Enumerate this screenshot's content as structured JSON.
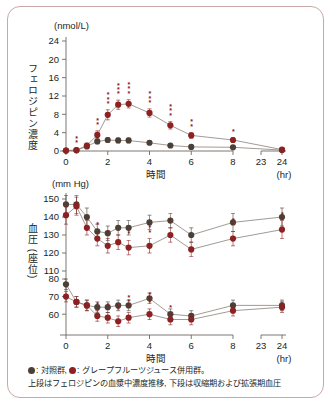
{
  "figure": {
    "border_color": "#c9a8a8",
    "control_color": "#4a4038",
    "grapefruit_color": "#8d2020"
  },
  "caption": {
    "legend_control_label": ": 対照群,",
    "legend_gfj_label": ": グレープフルーツジュース併用群。",
    "line2": "上段はフェロジピンの血漿中濃度推移, 下段は収縮期および拡張期血圧"
  },
  "chart_data": [
    {
      "id": "felodipine-concentration",
      "type": "line",
      "title": "",
      "unit_label": "(nmol/L)",
      "ylabel": "フェロジピン濃度",
      "xlabel": "時間",
      "xunit": "(hr)",
      "ylim": [
        0,
        24
      ],
      "yticks": [
        0,
        4,
        8,
        12,
        16,
        20,
        24
      ],
      "xticks": [
        0,
        2,
        4,
        6,
        8,
        23,
        24
      ],
      "axis_break": true,
      "grid": false,
      "legend_position": "below-figure",
      "x": [
        0,
        0.5,
        1,
        1.5,
        2,
        2.5,
        3,
        4,
        5,
        6,
        8,
        24
      ],
      "series": [
        {
          "name": "対照群",
          "color": "#4a4038",
          "values": [
            0.1,
            0.15,
            1.0,
            2.1,
            2.4,
            2.3,
            2.3,
            1.8,
            1.2,
            0.9,
            0.8,
            0.2
          ],
          "errors": [
            0.1,
            0.1,
            0.4,
            0.5,
            0.5,
            0.5,
            0.5,
            0.4,
            0.3,
            0.3,
            0.3,
            0.1
          ]
        },
        {
          "name": "グレープフルーツジュース併用群",
          "color": "#8d2020",
          "values": [
            0.1,
            0.2,
            1.2,
            3.5,
            7.9,
            10.1,
            10.3,
            8.3,
            5.6,
            3.4,
            2.4,
            0.3
          ],
          "errors": [
            0.1,
            0.15,
            0.5,
            0.9,
            1.1,
            1.0,
            0.9,
            0.9,
            0.8,
            0.6,
            0.5,
            0.15
          ],
          "significance": [
            "",
            "**",
            "",
            "**",
            "***",
            "***",
            "***",
            "***",
            "***",
            "**",
            "*",
            ""
          ]
        }
      ]
    },
    {
      "id": "blood-pressure-systolic",
      "type": "line",
      "unit_label": "(mm Hg)",
      "ylabel": "血圧 (座位)",
      "xlabel": "時間",
      "xunit": "(hr)",
      "ylim": [
        110,
        150
      ],
      "yticks": [
        110,
        120,
        130,
        140,
        150
      ],
      "xticks": [
        0,
        2,
        4,
        6,
        8,
        23,
        24
      ],
      "axis_break": true,
      "grid": false,
      "x": [
        0,
        0.5,
        1,
        1.5,
        2,
        2.5,
        3,
        4,
        5,
        6,
        8,
        24
      ],
      "series": [
        {
          "name": "対照群",
          "color": "#4a4038",
          "values": [
            147,
            147,
            140,
            132,
            131,
            134,
            134,
            137,
            138,
            130,
            137,
            140
          ],
          "errors": [
            5,
            5,
            5,
            4,
            4,
            4,
            4,
            4,
            4,
            4,
            5,
            5
          ]
        },
        {
          "name": "グレープフルーツジュース併用群",
          "color": "#8d2020",
          "values": [
            141,
            146,
            134,
            128,
            124,
            126,
            123,
            124,
            130,
            122,
            128,
            133
          ],
          "errors": [
            5,
            5,
            4,
            4,
            4,
            4,
            4,
            4,
            4,
            4,
            4,
            5
          ],
          "significance": [
            "",
            "",
            "",
            "*",
            "*",
            "",
            "*",
            "**",
            "*",
            "",
            "**",
            "*"
          ]
        }
      ]
    },
    {
      "id": "blood-pressure-diastolic",
      "type": "line",
      "unit_label": "",
      "ylim": [
        55,
        80
      ],
      "yticks": [
        60,
        70,
        80
      ],
      "xticks": [
        0,
        2,
        4,
        6,
        8,
        23,
        24
      ],
      "axis_break": true,
      "grid": false,
      "x": [
        0,
        0.5,
        1,
        1.5,
        2,
        2.5,
        3,
        4,
        5,
        6,
        8,
        24
      ],
      "series": [
        {
          "name": "対照群",
          "color": "#4a4038",
          "values": [
            77,
            67,
            65,
            64,
            64,
            65,
            65,
            69,
            60,
            59,
            65,
            65
          ],
          "errors": [
            3,
            3,
            3,
            3,
            3,
            3,
            3,
            3,
            3,
            3,
            3,
            3
          ]
        },
        {
          "name": "グレープフルーツジュース併用群",
          "color": "#8d2020",
          "values": [
            70,
            67,
            65,
            59,
            58,
            56,
            58,
            60,
            57,
            57,
            62,
            64
          ],
          "errors": [
            3,
            3,
            3,
            3,
            3,
            3,
            3,
            3,
            3,
            3,
            3,
            3
          ],
          "significance": [
            "",
            "",
            "",
            "*",
            "*",
            "**",
            "***",
            "***",
            "*",
            "",
            "",
            ""
          ]
        }
      ]
    }
  ]
}
